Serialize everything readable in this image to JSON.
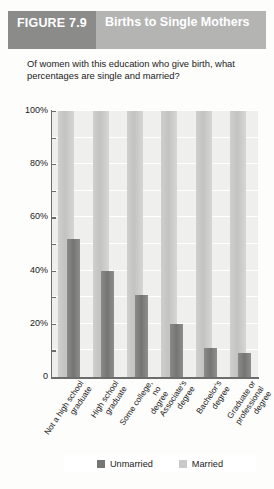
{
  "figure": {
    "number_label": "FIGURE 7.9",
    "title": "Births to Single Mothers",
    "subtitle": "Of women with this education who give birth, what percentages are single and married?"
  },
  "colors": {
    "header_band": "#b4b4b3",
    "figure_band": "#8b8b8a",
    "unmarried": "#757574",
    "married": "#c9c9c8",
    "plot_background": "#efefee",
    "axis": "#6d6d6d"
  },
  "chart_data": {
    "type": "bar",
    "title": "Births to Single Mothers",
    "subtitle": "Of women with this education who give birth, what percentages are single and married?",
    "xlabel": "",
    "ylabel": "",
    "ylim": [
      0,
      100
    ],
    "yticks": [
      0,
      20,
      40,
      60,
      80,
      100
    ],
    "ytick_labels": [
      "0",
      "20%",
      "40%",
      "60%",
      "80%",
      "100%"
    ],
    "grid": true,
    "legend_position": "bottom",
    "categories": [
      "Not a high school graduate",
      "High school graduate",
      "Some college, no degree",
      "Associate's degree",
      "Bachelor's degree",
      "Graduate or professional degree"
    ],
    "series": [
      {
        "name": "Unmarried",
        "color": "#757574",
        "values": [
          52,
          40,
          31,
          20,
          11,
          9
        ]
      },
      {
        "name": "Married",
        "color": "#c9c9c8",
        "values": [
          100,
          100,
          100,
          100,
          100,
          100
        ]
      }
    ]
  },
  "legend": {
    "items": [
      {
        "label": "Unmarried",
        "swatch": "unmarried"
      },
      {
        "label": "Married",
        "swatch": "married"
      }
    ]
  }
}
